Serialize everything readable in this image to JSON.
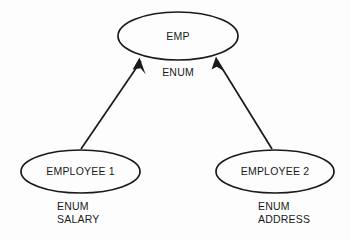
{
  "diagram": {
    "type": "er-generalization-diagram",
    "background_color": "#fdfdfd",
    "stroke_color": "#1a1a1a",
    "text_color": "#1a1a1a",
    "nodes": [
      {
        "id": "emp",
        "label": "EMP",
        "shape": "ellipse",
        "attributes_text": "ENUM",
        "attributes": [
          "ENUM"
        ],
        "attributes_align": "center"
      },
      {
        "id": "employee1",
        "label": "EMPLOYEE 1",
        "shape": "ellipse",
        "attributes_text": "ENUM\nSALARY",
        "attributes": [
          "ENUM",
          "SALARY"
        ],
        "attributes_align": "left"
      },
      {
        "id": "employee2",
        "label": "EMPLOYEE 2",
        "shape": "ellipse",
        "attributes_text": "ENUM\nADDRESS",
        "attributes": [
          "ENUM",
          "ADDRESS"
        ],
        "attributes_align": "left"
      }
    ],
    "edges": [
      {
        "id": "edge-employee1-emp",
        "from": "employee1",
        "to": "emp",
        "arrow": "to"
      },
      {
        "id": "edge-employee2-emp",
        "from": "employee2",
        "to": "emp",
        "arrow": "to"
      }
    ]
  }
}
